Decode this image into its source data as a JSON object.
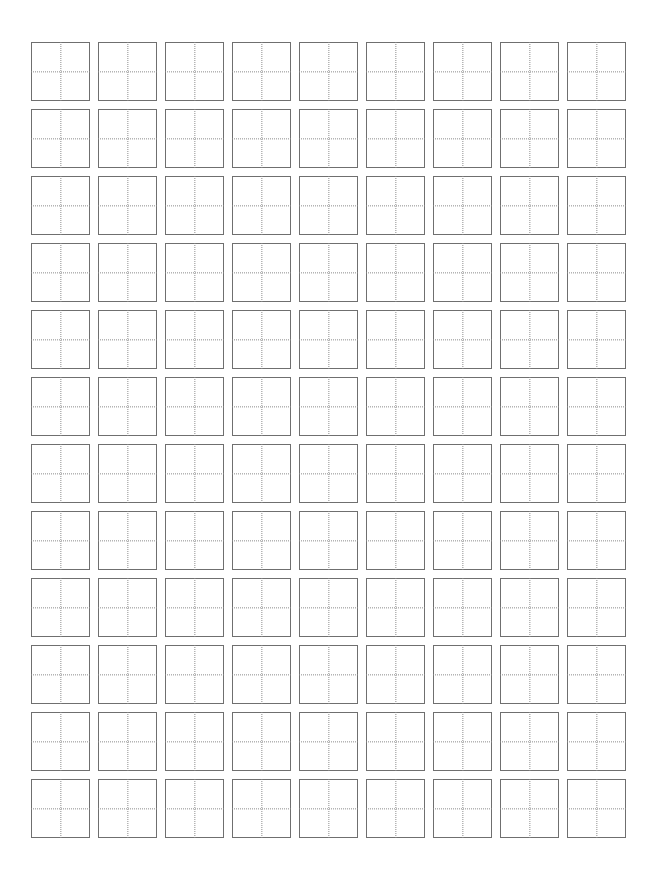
{
  "page": {
    "background_color": "#ffffff",
    "width": 661,
    "height": 883
  },
  "grid": {
    "name": "tian-zi-ge",
    "columns": 9,
    "rows": 12,
    "total_cells": 108,
    "cell_size_px": 59,
    "gap_px": 8,
    "margin_left_px": 31,
    "margin_top_px": 42,
    "border_color": "#6f6f6f",
    "border_width_px": 1.4,
    "guide_color": "#8c8c8c",
    "guide_style": "dotted",
    "cell_contents": [
      [
        "",
        "",
        "",
        "",
        "",
        "",
        "",
        "",
        ""
      ],
      [
        "",
        "",
        "",
        "",
        "",
        "",
        "",
        "",
        ""
      ],
      [
        "",
        "",
        "",
        "",
        "",
        "",
        "",
        "",
        ""
      ],
      [
        "",
        "",
        "",
        "",
        "",
        "",
        "",
        "",
        ""
      ],
      [
        "",
        "",
        "",
        "",
        "",
        "",
        "",
        "",
        ""
      ],
      [
        "",
        "",
        "",
        "",
        "",
        "",
        "",
        "",
        ""
      ],
      [
        "",
        "",
        "",
        "",
        "",
        "",
        "",
        "",
        ""
      ],
      [
        "",
        "",
        "",
        "",
        "",
        "",
        "",
        "",
        ""
      ],
      [
        "",
        "",
        "",
        "",
        "",
        "",
        "",
        "",
        ""
      ],
      [
        "",
        "",
        "",
        "",
        "",
        "",
        "",
        "",
        ""
      ],
      [
        "",
        "",
        "",
        "",
        "",
        "",
        "",
        "",
        ""
      ],
      [
        "",
        "",
        "",
        "",
        "",
        "",
        "",
        "",
        ""
      ]
    ]
  }
}
